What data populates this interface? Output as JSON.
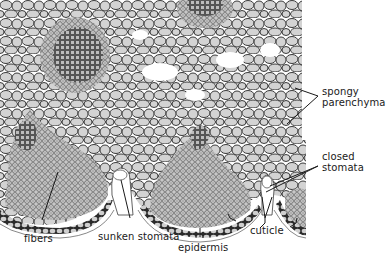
{
  "figure": {
    "colors": {
      "cell_fill": "#d3d3d3",
      "cell_wall": "#3a3a3a",
      "fiber_fill": "#bdbdbd",
      "background": "#ffffff",
      "text": "#1a1a1a"
    },
    "labels": [
      {
        "id": "spongy-parenchyma",
        "lines": [
          "spongy",
          "parenchyma"
        ]
      },
      {
        "id": "closed-stomata",
        "lines": [
          "closed",
          "stomata"
        ]
      },
      {
        "id": "fibers",
        "lines": [
          "fibers"
        ]
      },
      {
        "id": "sunken-stomata",
        "lines": [
          "sunken stomata"
        ]
      },
      {
        "id": "epidermis",
        "lines": [
          "epidermis"
        ]
      },
      {
        "id": "cuticle",
        "lines": [
          "cuticle"
        ]
      }
    ]
  }
}
